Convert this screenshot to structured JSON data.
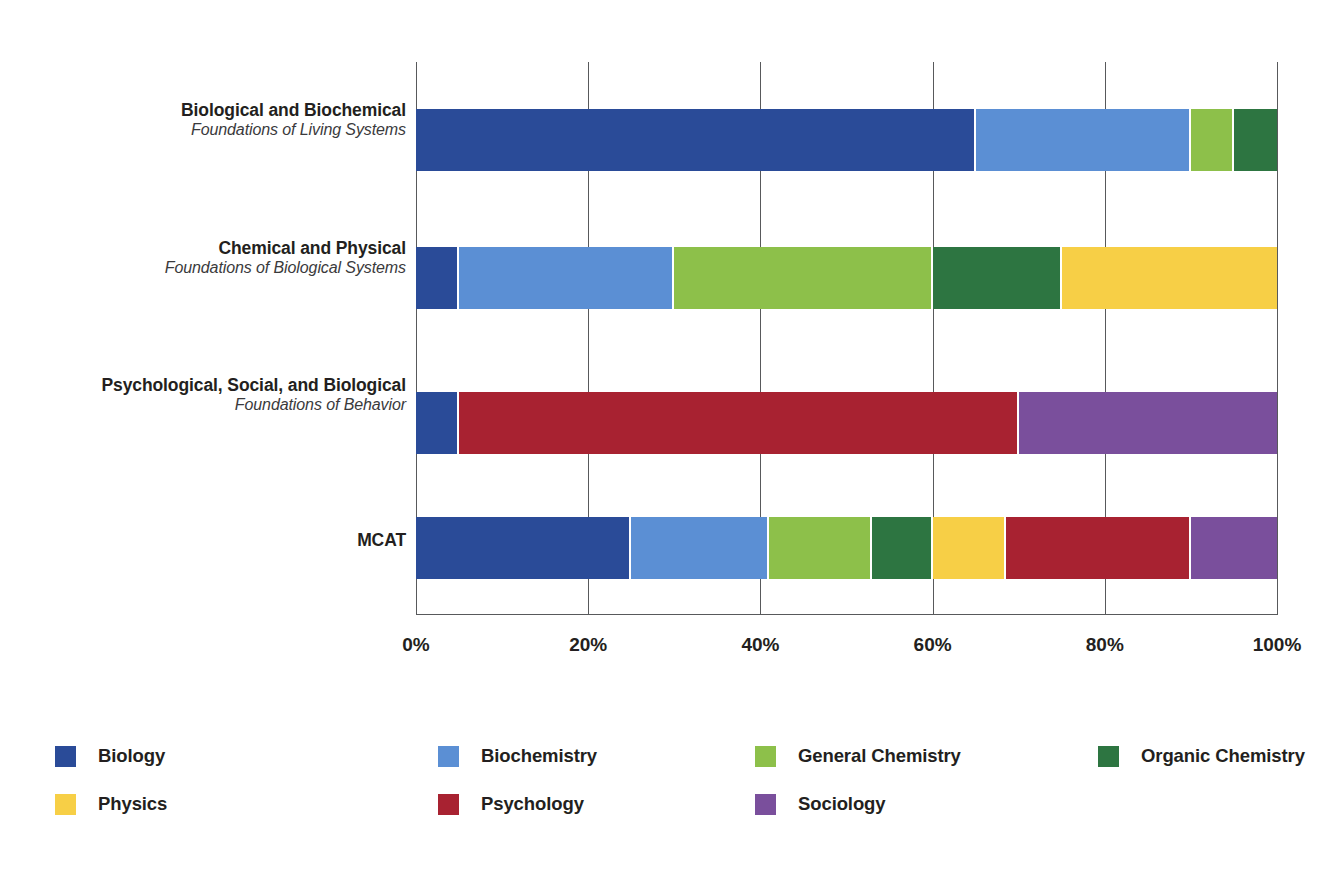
{
  "chart_data": {
    "type": "bar",
    "orientation": "horizontal",
    "stacked": true,
    "normalized_percent": true,
    "title": "",
    "subtitle": "",
    "xlabel": "",
    "ylabel": "",
    "xlim": [
      0,
      100
    ],
    "xticks": [
      0,
      20,
      40,
      60,
      80,
      100
    ],
    "xtick_labels": [
      "0%",
      "20%",
      "40%",
      "60%",
      "80%",
      "100%"
    ],
    "grid": true,
    "grid_axis": "x",
    "legend_position": "bottom",
    "categories": [
      "Biological and Biochemical",
      "Chemical and Physical",
      "Psychological, Social, and Biological",
      "MCAT"
    ],
    "category_subtitles": [
      "Foundations of Living Systems",
      "Foundations of Biological Systems",
      "Foundations of Behavior",
      ""
    ],
    "series": [
      {
        "name": "Biology",
        "color": "#2a4b98",
        "values": [
          65,
          5,
          5,
          25
        ]
      },
      {
        "name": "Biochemistry",
        "color": "#5b8fd4",
        "values": [
          25,
          25,
          0,
          16
        ]
      },
      {
        "name": "General Chemistry",
        "color": "#8dc04a",
        "values": [
          5,
          30,
          0,
          12
        ]
      },
      {
        "name": "Organic Chemistry",
        "color": "#2d7541",
        "values": [
          5,
          15,
          0,
          7
        ]
      },
      {
        "name": "Physics",
        "color": "#f7cf46",
        "values": [
          0,
          25,
          0,
          8.5
        ]
      },
      {
        "name": "Psychology",
        "color": "#a82231",
        "values": [
          0,
          0,
          65,
          21.5
        ]
      },
      {
        "name": "Sociology",
        "color": "#7a4f9c",
        "values": [
          0,
          0,
          30,
          10
        ]
      }
    ]
  },
  "legend": {
    "items": [
      {
        "label": "Biology",
        "color": "#2a4b98"
      },
      {
        "label": "Biochemistry",
        "color": "#5b8fd4"
      },
      {
        "label": "General Chemistry",
        "color": "#8dc04a"
      },
      {
        "label": "Organic Chemistry",
        "color": "#2d7541"
      },
      {
        "label": "Physics",
        "color": "#f7cf46"
      },
      {
        "label": "Psychology",
        "color": "#a82231"
      },
      {
        "label": "Sociology",
        "color": "#7a4f9c"
      }
    ]
  }
}
